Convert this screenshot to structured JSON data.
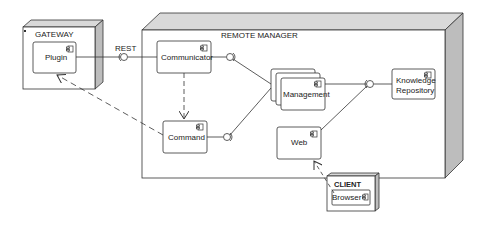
{
  "diagram": {
    "type": "UML deployment/component diagram",
    "nodes": [
      {
        "id": "gateway",
        "label": "GATEWAY",
        "components": [
          "Plugin"
        ]
      },
      {
        "id": "remote_manager",
        "label": "REMOTE MANAGER",
        "components": [
          "Communicator",
          "Command",
          "Management",
          "Web",
          "Knowledge Repository"
        ]
      },
      {
        "id": "client",
        "label": "CLIENT",
        "components": [
          "Browser"
        ]
      }
    ],
    "components": {
      "plugin": "Plugin",
      "communicator": "Communicator",
      "command": "Command",
      "management": "Management",
      "web": "Web",
      "knowledge_line1": "Knowledge",
      "knowledge_line2": "Repository",
      "browser": "Browser"
    },
    "node_labels": {
      "gateway": "GATEWAY",
      "remote_manager": "REMOTE MANAGER",
      "client": "CLIENT"
    },
    "interface_labels": {
      "rest": "REST"
    },
    "connections": [
      {
        "from": "Plugin",
        "to": "Communicator",
        "kind": "interface",
        "label": "REST"
      },
      {
        "from": "Communicator",
        "to": "Management",
        "kind": "interface"
      },
      {
        "from": "Command",
        "to": "Management",
        "kind": "interface"
      },
      {
        "from": "Management",
        "to": "Knowledge Repository",
        "kind": "interface"
      },
      {
        "from": "Web",
        "to": "Knowledge Repository",
        "kind": "interface"
      },
      {
        "from": "Communicator",
        "to": "Command",
        "kind": "dependency"
      },
      {
        "from": "Command",
        "to": "Plugin",
        "kind": "dependency"
      },
      {
        "from": "Browser",
        "to": "Web",
        "kind": "dependency"
      }
    ],
    "colors": {
      "line": "#333333",
      "node_side": "#c8c8c8",
      "node_top": "#d9d9d9",
      "background": "#ffffff"
    }
  }
}
